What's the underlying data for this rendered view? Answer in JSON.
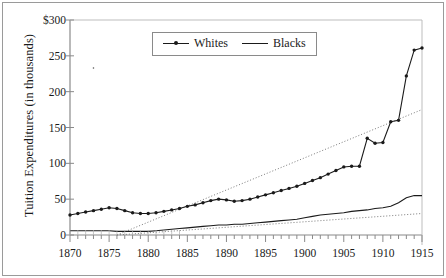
{
  "chart_data": {
    "type": "line",
    "title": "",
    "xlabel": "",
    "ylabel": "Tuition Expenditures (in thousands)",
    "xlim": [
      1870,
      1915
    ],
    "ylim": [
      0,
      300
    ],
    "grid": false,
    "legend_position": "top-center",
    "y_ticks": [
      "0",
      "50",
      "100",
      "150",
      "200",
      "250",
      "$300"
    ],
    "y_tick_values": [
      0,
      50,
      100,
      150,
      200,
      250,
      300
    ],
    "x_ticks": [
      "1870",
      "1875",
      "1880",
      "1885",
      "1890",
      "1895",
      "1900",
      "1905",
      "1910",
      "1915"
    ],
    "x_tick_values": [
      1870,
      1875,
      1880,
      1885,
      1890,
      1895,
      1900,
      1905,
      1910,
      1915
    ],
    "x_minor_tick_step": 1,
    "series": [
      {
        "name": "Whites",
        "style": "line-with-markers",
        "color": "#1a1a1a",
        "x": [
          1870,
          1871,
          1872,
          1873,
          1874,
          1875,
          1876,
          1877,
          1878,
          1879,
          1880,
          1881,
          1882,
          1883,
          1884,
          1885,
          1886,
          1887,
          1888,
          1889,
          1890,
          1891,
          1892,
          1893,
          1894,
          1895,
          1896,
          1897,
          1898,
          1899,
          1900,
          1901,
          1902,
          1903,
          1904,
          1905,
          1906,
          1907,
          1908,
          1909,
          1910,
          1911,
          1912,
          1913,
          1914,
          1915
        ],
        "values": [
          28,
          30,
          32,
          34,
          36,
          38,
          37,
          34,
          31,
          30,
          30,
          31,
          33,
          35,
          37,
          40,
          42,
          45,
          48,
          50,
          49,
          47,
          48,
          50,
          53,
          56,
          59,
          62,
          65,
          68,
          72,
          76,
          80,
          85,
          90,
          95,
          96,
          96,
          135,
          128,
          129,
          158,
          160,
          222,
          258,
          261
        ]
      },
      {
        "name": "Blacks",
        "style": "line",
        "color": "#1a1a1a",
        "x": [
          1870,
          1871,
          1872,
          1873,
          1874,
          1875,
          1876,
          1877,
          1878,
          1879,
          1880,
          1881,
          1882,
          1883,
          1884,
          1885,
          1886,
          1887,
          1888,
          1889,
          1890,
          1891,
          1892,
          1893,
          1894,
          1895,
          1896,
          1897,
          1898,
          1899,
          1900,
          1901,
          1902,
          1903,
          1904,
          1905,
          1906,
          1907,
          1908,
          1909,
          1910,
          1911,
          1912,
          1913,
          1914,
          1915
        ],
        "values": [
          6,
          6,
          6,
          6,
          6,
          6,
          5,
          5,
          5,
          5,
          5,
          6,
          7,
          8,
          9,
          10,
          11,
          12,
          13,
          14,
          14,
          15,
          15,
          16,
          17,
          18,
          19,
          20,
          21,
          22,
          24,
          26,
          28,
          29,
          30,
          31,
          33,
          34,
          35,
          37,
          38,
          40,
          45,
          52,
          55,
          55
        ]
      }
    ],
    "trend_lines": [
      {
        "name": "Whites trend",
        "style": "dotted",
        "color": "#7a7a7a",
        "x": [
          1876,
          1915
        ],
        "values": [
          0,
          175
        ]
      },
      {
        "name": "Blacks trend",
        "style": "dotted",
        "color": "#7a7a7a",
        "x": [
          1876,
          1915
        ],
        "values": [
          0,
          30
        ]
      }
    ],
    "legend": [
      {
        "label": "Whites",
        "marker": "line-with-dot"
      },
      {
        "label": "Blacks",
        "marker": "line"
      }
    ],
    "annotations": [
      {
        "text": ".",
        "x": 1873,
        "y": 233,
        "note": "stray mark near 1873 at ~233"
      }
    ],
    "colors": {
      "series": "#1a1a1a",
      "trend": "#7a7a7a",
      "axis": "#8a8a8a",
      "background": "#ffffff"
    }
  }
}
